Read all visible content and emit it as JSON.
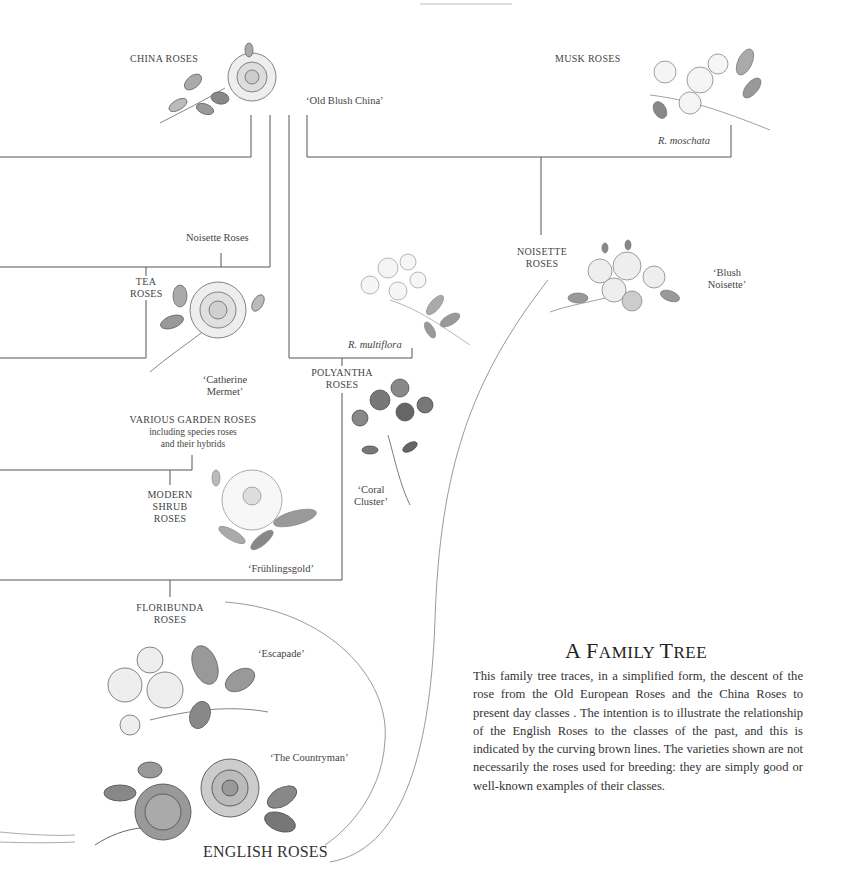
{
  "diagram": {
    "title_first": "A ",
    "title_cap1": "F",
    "title_small1": "AMILY ",
    "title_cap2": "T",
    "title_small2": "REE",
    "description": "This family tree traces, in a simplified form, the descent of the rose from the Old European Roses and the China Roses to present day classes . The intention is to illustrate the relationship of the English Roses to the classes of the past, and this is indicated by the curving brown lines. The varieties shown are not necessarily the roses used for breeding: they are simply good or well-known examples of their classes.",
    "classes": {
      "china_roses": "CHINA ROSES",
      "musk_roses": "MUSK ROSES",
      "noisette_roses_small": "Noisette Roses",
      "tea_roses_l1": "TEA",
      "tea_roses_l2": "ROSES",
      "noisette_roses_l1": "NOISETTE",
      "noisette_roses_l2": "ROSES",
      "polyantha_l1": "POLYANTHA",
      "polyantha_l2": "ROSES",
      "various_garden_l1": "VARIOUS GARDEN ROSES",
      "various_garden_l2": "including species roses",
      "various_garden_l3": "and their hybrids",
      "modern_shrub_l1": "MODERN",
      "modern_shrub_l2": "SHRUB",
      "modern_shrub_l3": "ROSES",
      "floribunda_l1": "FLORIBUNDA",
      "floribunda_l2": "ROSES",
      "english_roses": "ENGLISH ROSES"
    },
    "varieties": {
      "old_blush_china": "‘Old Blush China’",
      "r_moschata": "R. moschata",
      "blush_noisette_l1": "‘Blush",
      "blush_noisette_l2": "Noisette’",
      "catherine_mermet_l1": "‘Catherine",
      "catherine_mermet_l2": "Mermet’",
      "r_multiflora": "R. multiflora",
      "coral_cluster_l1": "‘Coral",
      "coral_cluster_l2": "Cluster’",
      "fruhlingsgold": "‘Frühlingsgold’",
      "escapade": "‘Escapade’",
      "the_countryman": "‘The Countryman’"
    },
    "colors": {
      "tree_line": "#555555",
      "curve_line": "#9a9a9a",
      "text": "#333333"
    }
  }
}
